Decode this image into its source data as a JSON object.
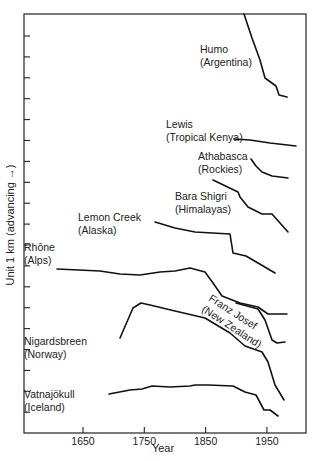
{
  "chart_data": {
    "type": "line",
    "title": "",
    "xlabel": "Year",
    "ylabel": "Unit 1 km (advancing →)",
    "xlim": [
      1550,
      2010
    ],
    "x_ticks": [
      1650,
      1750,
      1850,
      1950
    ],
    "y_ticks_count": 19,
    "y_unit_km_per_tick": 1,
    "grid": false,
    "legend": "inline labels",
    "series": [
      {
        "name": "Humo (Argentina)",
        "label_lines": [
          "Humo",
          "(Argentina)"
        ],
        "label_pos": [
          200,
          53
        ],
        "points_px": [
          [
            244,
            14
          ],
          [
            252,
            38
          ],
          [
            260,
            60
          ],
          [
            265,
            78
          ],
          [
            276,
            86
          ],
          [
            279,
            95
          ],
          [
            287,
            97
          ]
        ],
        "years": [
          1910,
          1925,
          1935,
          1950,
          1960
        ]
      },
      {
        "name": "Lewis (Tropical Kenya)",
        "label_lines": [
          "Lewis",
          "(Tropical Kenya)"
        ],
        "label_pos": [
          166,
          128
        ],
        "points_px": [
          [
            234,
            139
          ],
          [
            250,
            140
          ],
          [
            270,
            143
          ],
          [
            296,
            146
          ]
        ],
        "years": [
          1895,
          1920,
          1950,
          1990
        ]
      },
      {
        "name": "Athabasca (Rockies)",
        "label_lines": [
          "Athabasca",
          "(Rockies)"
        ],
        "label_pos": [
          198,
          160
        ],
        "points_px": [
          [
            251,
            159
          ],
          [
            256,
            166
          ],
          [
            262,
            172
          ],
          [
            272,
            176
          ],
          [
            288,
            178
          ]
        ],
        "years": [
          1925,
          1940,
          1970
        ]
      },
      {
        "name": "Bara Shigri (Himalayas)",
        "label_lines": [
          "Bara Shigri",
          "(Himalayas)"
        ],
        "label_pos": [
          175,
          200
        ],
        "points_px": [
          [
            213,
            180
          ],
          [
            238,
            192
          ],
          [
            240,
            197
          ],
          [
            248,
            207
          ],
          [
            262,
            214
          ],
          [
            272,
            214
          ],
          [
            288,
            232
          ]
        ],
        "years": [
          1862,
          1900,
          1925,
          1940,
          1970
        ]
      },
      {
        "name": "Lemon Creek (Alaska)",
        "label_lines": [
          "Lemon Creek",
          "(Alaska)"
        ],
        "label_pos": [
          78,
          221
        ],
        "points_px": [
          [
            155,
            222
          ],
          [
            175,
            228
          ],
          [
            195,
            232
          ],
          [
            230,
            234
          ],
          [
            233,
            253
          ],
          [
            246,
            256
          ],
          [
            258,
            263
          ],
          [
            275,
            273
          ]
        ],
        "years": [
          1767,
          1800,
          1890,
          1920,
          1960
        ]
      },
      {
        "name": "Rhône (Alps)",
        "label_lines": [
          "Rhône",
          "(Alps)"
        ],
        "label_pos": [
          24,
          251
        ],
        "points_px": [
          [
            57,
            269
          ],
          [
            100,
            271
          ],
          [
            120,
            274
          ],
          [
            140,
            275
          ],
          [
            160,
            272
          ],
          [
            175,
            271
          ],
          [
            190,
            268
          ],
          [
            205,
            272
          ],
          [
            213,
            283
          ],
          [
            222,
            296
          ],
          [
            240,
            303
          ],
          [
            258,
            307
          ],
          [
            268,
            314
          ],
          [
            287,
            314
          ]
        ],
        "years": [
          1608,
          1680,
          1750,
          1800,
          1850,
          1870,
          1900,
          1930,
          1960
        ]
      },
      {
        "name": "Franz Josef (New Zealand)",
        "label_lines": [
          "Franz Josef",
          "(New Zealand)"
        ],
        "label_pos": [
          208,
          300
        ],
        "label_rotation_deg": 33,
        "points_px": [
          [
            236,
            303
          ],
          [
            258,
            309
          ],
          [
            265,
            320
          ],
          [
            272,
            340
          ],
          [
            277,
            343
          ],
          [
            285,
            342
          ]
        ],
        "years": [
          1900,
          1935,
          1945,
          1955,
          1970
        ]
      },
      {
        "name": "Nigardsbreen (Norway)",
        "label_lines": [
          "Nigardsbreen",
          "(Norway)"
        ],
        "label_pos": [
          24,
          345
        ],
        "points_px": [
          [
            120,
            338
          ],
          [
            133,
            308
          ],
          [
            141,
            303
          ],
          [
            150,
            305
          ],
          [
            175,
            311
          ],
          [
            205,
            318
          ],
          [
            230,
            333
          ],
          [
            245,
            346
          ],
          [
            262,
            352
          ],
          [
            268,
            362
          ],
          [
            275,
            385
          ],
          [
            284,
            400
          ]
        ],
        "years": [
          1710,
          1732,
          1748,
          1800,
          1850,
          1890,
          1930,
          1950,
          1975
        ]
      },
      {
        "name": "Vatnajökull (Iceland)",
        "label_lines": [
          "Vatnajökull",
          "(Iceland)"
        ],
        "label_pos": [
          24,
          398
        ],
        "points_px": [
          [
            109,
            394
          ],
          [
            130,
            390
          ],
          [
            142,
            389
          ],
          [
            152,
            386
          ],
          [
            170,
            387
          ],
          [
            190,
            386
          ],
          [
            195,
            385
          ],
          [
            208,
            385
          ],
          [
            233,
            386
          ],
          [
            245,
            392
          ],
          [
            256,
            395
          ],
          [
            264,
            410
          ],
          [
            270,
            410
          ],
          [
            278,
            416
          ]
        ],
        "years": [
          1690,
          1750,
          1800,
          1850,
          1890,
          1930,
          1945,
          1960,
          1970
        ]
      }
    ]
  },
  "axes": {
    "x_tick_labels": [
      "1650",
      "1750",
      "1850",
      "1950"
    ],
    "x_title": "Year",
    "y_title": "Unit 1 km (advancing →)"
  }
}
